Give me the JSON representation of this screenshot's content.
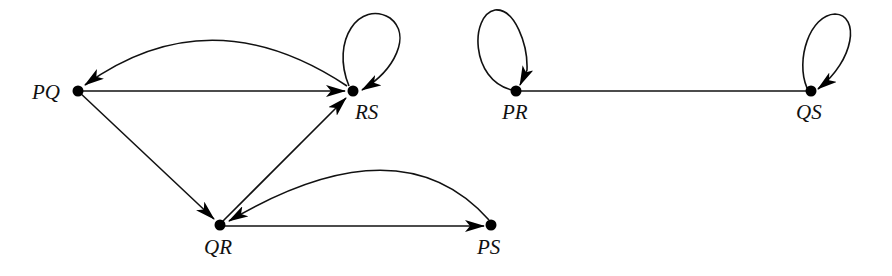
{
  "diagram": {
    "type": "directed-graph",
    "nodes": [
      {
        "id": "PQ",
        "label": "PQ",
        "x": 78,
        "y": 91
      },
      {
        "id": "RS",
        "label": "RS",
        "x": 353,
        "y": 91
      },
      {
        "id": "QR",
        "label": "QR",
        "x": 220,
        "y": 225
      },
      {
        "id": "PS",
        "label": "PS",
        "x": 491,
        "y": 225
      },
      {
        "id": "PR",
        "label": "PR",
        "x": 516,
        "y": 91
      },
      {
        "id": "QS",
        "label": "QS",
        "x": 811,
        "y": 91
      }
    ],
    "edges": [
      {
        "from": "PQ",
        "to": "RS",
        "shape": "straight",
        "directed": true
      },
      {
        "from": "RS",
        "to": "PQ",
        "shape": "arc",
        "directed": true
      },
      {
        "from": "RS",
        "to": "RS",
        "shape": "loop",
        "directed": true
      },
      {
        "from": "PQ",
        "to": "QR",
        "shape": "straight",
        "directed": true
      },
      {
        "from": "QR",
        "to": "RS",
        "shape": "straight",
        "directed": true
      },
      {
        "from": "QR",
        "to": "PS",
        "shape": "straight",
        "directed": true
      },
      {
        "from": "PS",
        "to": "QR",
        "shape": "arc",
        "directed": true
      },
      {
        "from": "PR",
        "to": "PR",
        "shape": "loop",
        "directed": true
      },
      {
        "from": "QS",
        "to": "QS",
        "shape": "loop",
        "directed": true
      },
      {
        "from": "PR",
        "to": "QS",
        "shape": "straight",
        "directed": false
      }
    ]
  },
  "labels": {
    "PQ": "PQ",
    "RS": "RS",
    "QR": "QR",
    "PS": "PS",
    "PR": "PR",
    "QS": "QS"
  }
}
